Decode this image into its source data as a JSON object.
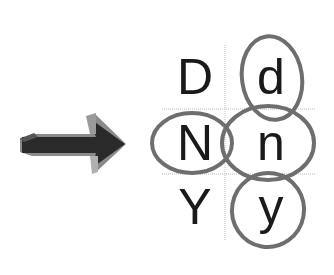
{
  "diagram": {
    "arrow": {
      "direction": "right",
      "color": "#2a2a2a",
      "highlight": "#8a8a8a"
    },
    "grid": {
      "columns": [
        "uppercase",
        "lowercase"
      ],
      "rows": [
        {
          "upper": "D",
          "lower": "d"
        },
        {
          "upper": "N",
          "lower": "n"
        },
        {
          "upper": "Y",
          "lower": "y"
        }
      ],
      "line_color": "#bbbbbb"
    },
    "circled": [
      "d",
      "N",
      "n",
      "y"
    ],
    "circle_color": "#6e6e6e"
  }
}
